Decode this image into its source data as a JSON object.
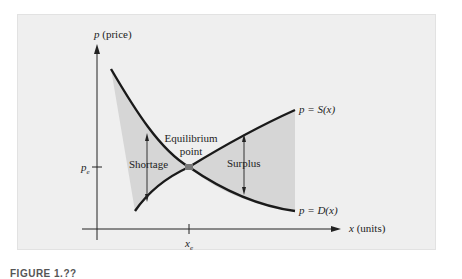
{
  "figure": {
    "y_axis_label_var": "p",
    "y_axis_label_unit": " (price)",
    "x_axis_label_var": "x",
    "x_axis_label_unit": " (units)",
    "pe_label": "p",
    "pe_sub": "e",
    "xe_label": "x",
    "xe_sub": "e",
    "supply_label": "p = S(x)",
    "demand_label": "p = D(x)",
    "equilibrium_line1": "Equilibrium",
    "equilibrium_line2": "point",
    "shortage_label": "Shortage",
    "surplus_label": "Surplus",
    "caption": "FIGURE 1.??"
  },
  "colors": {
    "panel_bg": "#efefef",
    "shaded_region": "#d6d6d6",
    "curve": "#1a1a1a",
    "equilibrium_dot": "#777777"
  }
}
